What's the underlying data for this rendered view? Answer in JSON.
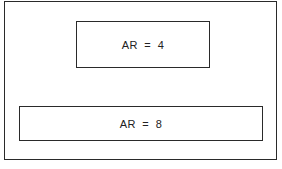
{
  "diagram": {
    "boxes": [
      {
        "label": "AR  =  4"
      },
      {
        "label": "AR  =  8"
      }
    ]
  }
}
